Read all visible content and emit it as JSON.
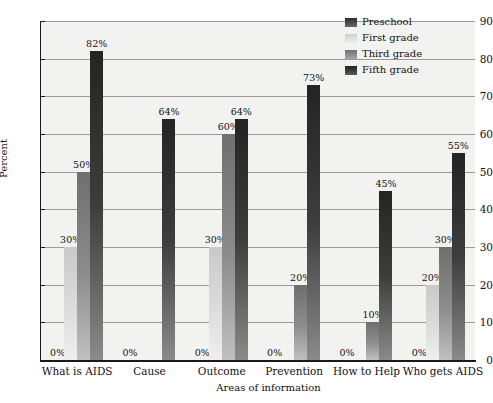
{
  "chart_data": {
    "type": "bar",
    "title": "",
    "xlabel": "Areas of information",
    "ylabel": "Percent",
    "ylim": [
      0,
      90
    ],
    "ytick_step": 10,
    "yticks": [
      0,
      10,
      20,
      30,
      40,
      50,
      60,
      70,
      80,
      90
    ],
    "grid": true,
    "legend_position": "top-right",
    "value_labels_suffix": "%",
    "categories": [
      "What is AIDS",
      "Cause",
      "Outcome",
      "Prevention",
      "How to Help",
      "Who gets AIDS"
    ],
    "series": [
      {
        "name": "Preschool",
        "color": "#2b2b2b",
        "values": [
          0,
          0,
          0,
          0,
          0,
          0
        ]
      },
      {
        "name": "First grade",
        "color": "#d8d8d8",
        "values": [
          30,
          0,
          30,
          0,
          0,
          20
        ]
      },
      {
        "name": "Third grade",
        "color": "#8d8d8d",
        "values": [
          50,
          0,
          60,
          20,
          10,
          30
        ]
      },
      {
        "name": "Fifth grade",
        "color": "#242424",
        "values": [
          82,
          64,
          64,
          73,
          45,
          55
        ]
      }
    ],
    "point_labels": [
      {
        "category": "What is AIDS",
        "series": "Preschool",
        "text": "0%"
      },
      {
        "category": "What is AIDS",
        "series": "First grade",
        "text": "30%"
      },
      {
        "category": "What is AIDS",
        "series": "Third grade",
        "text": "50%"
      },
      {
        "category": "What is AIDS",
        "series": "Fifth grade",
        "text": "82%"
      },
      {
        "category": "Cause",
        "series": "Preschool",
        "text": "0%"
      },
      {
        "category": "Cause",
        "series": "Fifth grade",
        "text": "64%"
      },
      {
        "category": "Outcome",
        "series": "Preschool",
        "text": "0%"
      },
      {
        "category": "Outcome",
        "series": "First grade",
        "text": "30%"
      },
      {
        "category": "Outcome",
        "series": "Third grade",
        "text": "60%"
      },
      {
        "category": "Outcome",
        "series": "Fifth grade",
        "text": "64%"
      },
      {
        "category": "Prevention",
        "series": "Preschool",
        "text": "0%"
      },
      {
        "category": "Prevention",
        "series": "Third grade",
        "text": "20%"
      },
      {
        "category": "Prevention",
        "series": "Fifth grade",
        "text": "73%"
      },
      {
        "category": "How to Help",
        "series": "Preschool",
        "text": "0%"
      },
      {
        "category": "How to Help",
        "series": "Third grade",
        "text": "10%"
      },
      {
        "category": "How to Help",
        "series": "Fifth grade",
        "text": "45%"
      },
      {
        "category": "Who gets AIDS",
        "series": "Preschool",
        "text": "0%"
      },
      {
        "category": "Who gets AIDS",
        "series": "First grade",
        "text": "20%"
      },
      {
        "category": "Who gets AIDS",
        "series": "Third grade",
        "text": "30%"
      },
      {
        "category": "Who gets AIDS",
        "series": "Fifth grade",
        "text": "55%"
      }
    ]
  },
  "axes": {
    "y_title": "Percent",
    "x_title": "Areas of information",
    "y_ticks": [
      "0",
      "10",
      "20",
      "30",
      "40",
      "50",
      "60",
      "70",
      "80",
      "90"
    ]
  },
  "legend": {
    "items": [
      {
        "label": "Preschool"
      },
      {
        "label": "First grade"
      },
      {
        "label": "Third grade"
      },
      {
        "label": "Fifth grade"
      }
    ]
  },
  "style": {
    "plot_background": "#f2f2f0",
    "gridline_color": "#9a9a9a",
    "axis_color": "#1a1a1a",
    "text_color": "#111111"
  }
}
